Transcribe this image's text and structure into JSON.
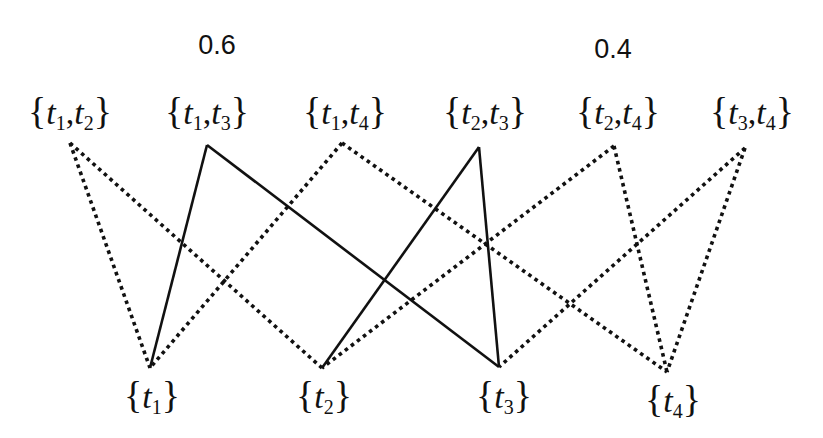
{
  "diagram": {
    "probabilities": [
      {
        "label": "0.6",
        "x": 217,
        "y": 30
      },
      {
        "label": "0.4",
        "x": 613,
        "y": 34
      }
    ],
    "top_nodes": [
      {
        "id": "t1t2",
        "a": "1",
        "b": "2",
        "x": 70,
        "y": 92,
        "anchor": [
          70,
          143
        ]
      },
      {
        "id": "t1t3",
        "a": "1",
        "b": "3",
        "x": 207,
        "y": 92,
        "anchor": [
          207,
          145
        ]
      },
      {
        "id": "t1t4",
        "a": "1",
        "b": "4",
        "x": 345,
        "y": 92,
        "anchor": [
          342,
          143
        ]
      },
      {
        "id": "t2t3",
        "a": "2",
        "b": "3",
        "x": 485,
        "y": 92,
        "anchor": [
          479,
          147
        ]
      },
      {
        "id": "t2t4",
        "a": "2",
        "b": "4",
        "x": 618,
        "y": 92,
        "anchor": [
          614,
          146
        ]
      },
      {
        "id": "t3t4",
        "a": "3",
        "b": "4",
        "x": 752,
        "y": 92,
        "anchor": [
          745,
          148
        ]
      }
    ],
    "bottom_nodes": [
      {
        "id": "t1",
        "a": "1",
        "x": 152,
        "y": 376,
        "anchor": [
          150,
          368
        ]
      },
      {
        "id": "t2",
        "a": "2",
        "x": 324,
        "y": 376,
        "anchor": [
          322,
          368
        ]
      },
      {
        "id": "t3",
        "a": "3",
        "x": 504,
        "y": 376,
        "anchor": [
          499,
          367
        ]
      },
      {
        "id": "t4",
        "a": "4",
        "x": 673,
        "y": 380,
        "anchor": [
          667,
          372
        ]
      }
    ],
    "edges": [
      {
        "from": "t1t2",
        "to": "t1",
        "style": "dotted"
      },
      {
        "from": "t1t2",
        "to": "t2",
        "style": "dotted"
      },
      {
        "from": "t1t3",
        "to": "t1",
        "style": "solid"
      },
      {
        "from": "t1t3",
        "to": "t3",
        "style": "solid"
      },
      {
        "from": "t1t4",
        "to": "t1",
        "style": "dotted"
      },
      {
        "from": "t1t4",
        "to": "t4",
        "style": "dotted"
      },
      {
        "from": "t2t3",
        "to": "t2",
        "style": "solid"
      },
      {
        "from": "t2t3",
        "to": "t3",
        "style": "solid"
      },
      {
        "from": "t2t4",
        "to": "t2",
        "style": "dotted"
      },
      {
        "from": "t2t4",
        "to": "t4",
        "style": "dotted"
      },
      {
        "from": "t3t4",
        "to": "t3",
        "style": "dotted"
      },
      {
        "from": "t3t4",
        "to": "t4",
        "style": "dotted"
      }
    ],
    "colors": {
      "line": "#111111",
      "background": "#ffffff"
    }
  }
}
